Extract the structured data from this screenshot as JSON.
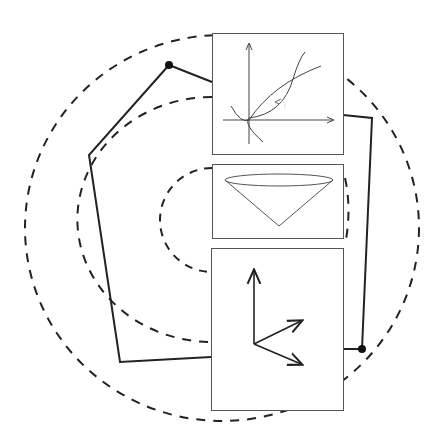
{
  "diagram": {
    "colors": {
      "stroke": "#222222",
      "panel_border": "#555555",
      "background": "#ffffff"
    },
    "polygon": {
      "vertices": [
        [
          169,
          65
        ],
        [
          372,
          118
        ],
        [
          362,
          349
        ],
        [
          120,
          362
        ],
        [
          89,
          155
        ]
      ],
      "marked_vertices": [
        [
          169,
          65
        ],
        [
          362,
          349
        ]
      ]
    },
    "dashed_arcs": [
      {
        "name": "outer",
        "cx": 222,
        "cy": 228,
        "rx": 197,
        "ry": 193
      },
      {
        "name": "middle",
        "cx": 222,
        "cy": 220,
        "rx": 134,
        "ry": 122
      },
      {
        "name": "inner",
        "cx": 222,
        "cy": 220,
        "rx": 61,
        "ry": 52
      }
    ],
    "panels": [
      {
        "name": "curves-panel",
        "content": "two curves crossing on x-y axes with small annotation arrow",
        "annotation": ""
      },
      {
        "name": "cone-panel",
        "content": "inverted cone"
      },
      {
        "name": "vectors-panel",
        "content": "three arrows from common origin"
      }
    ]
  }
}
